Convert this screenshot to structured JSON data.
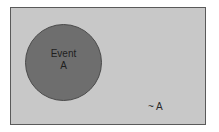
{
  "diagram": {
    "type": "venn",
    "universe": {
      "fill": "#c8c8c8",
      "border": "#5a5a5a"
    },
    "event": {
      "label_line1": "Event",
      "label_line2": "A",
      "fill": "#6e6e6e"
    },
    "complement": {
      "label": "~ A"
    }
  }
}
